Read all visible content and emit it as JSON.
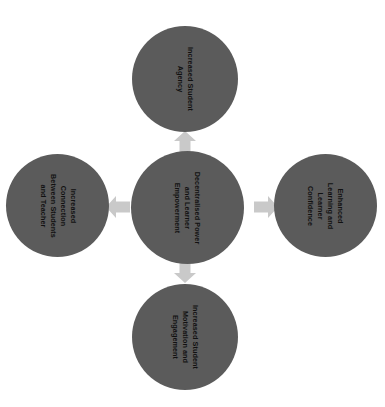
{
  "diagram": {
    "type": "hub-and-spoke",
    "title": "Decentralised Power and Learner Empowerment",
    "background_color": "#ffffff",
    "node_color": "#5b5b5b",
    "node_text_color": "#111111",
    "arrow_color": "#c9c9c9",
    "text_rotation_degrees": 90,
    "center": {
      "id": "center",
      "label": "Decentralised Power and Learner Empowerment",
      "lines": [
        "Decentralised Power",
        "and Learner",
        "Empowerment"
      ]
    },
    "outcomes": [
      {
        "id": "top",
        "position": "top",
        "label": "Increased Student Agency",
        "lines": [
          "Increased Student",
          "Agency"
        ]
      },
      {
        "id": "left",
        "position": "left",
        "label": "Increased Connection Between Students and Teacher",
        "lines": [
          "Increased",
          "Connection",
          "Between Students",
          "and Teacher"
        ]
      },
      {
        "id": "right",
        "position": "right",
        "label": "Enhanced Learning and Learner Confidence",
        "lines": [
          "Enhanced",
          "Learning and",
          "Learner",
          "Confidence"
        ]
      },
      {
        "id": "bottom",
        "position": "bottom",
        "label": "Increased Student Motivation and Engagement",
        "lines": [
          "Increased Student",
          "Motivation and",
          "Engagement"
        ]
      }
    ],
    "arrows": [
      {
        "id": "arrow-up",
        "direction": "up",
        "from": "center",
        "to": "top"
      },
      {
        "id": "arrow-left",
        "direction": "left",
        "from": "center",
        "to": "left"
      },
      {
        "id": "arrow-right",
        "direction": "right",
        "from": "center",
        "to": "right"
      },
      {
        "id": "arrow-down",
        "direction": "down",
        "from": "center",
        "to": "bottom"
      }
    ]
  }
}
